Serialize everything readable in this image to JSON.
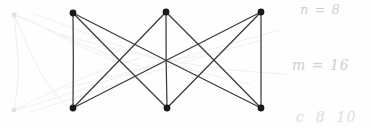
{
  "figure": {
    "background_color": "#fefefe",
    "width": 371,
    "height": 128
  },
  "graph": {
    "vertex_color": "#1a1a1a",
    "edge_color": "#3a3a3a",
    "vertex_radius": 3.4,
    "edge_width": 1.25,
    "vertices": [
      {
        "id": "t1",
        "label": "",
        "x": 73,
        "y": 13,
        "row": "top",
        "column": 1
      },
      {
        "id": "t2",
        "label": "",
        "x": 166,
        "y": 12,
        "row": "top",
        "column": 2
      },
      {
        "id": "t3",
        "label": "",
        "x": 261,
        "y": 12,
        "row": "top",
        "column": 3
      },
      {
        "id": "b1",
        "label": "",
        "x": 73,
        "y": 108,
        "row": "bottom",
        "column": 1
      },
      {
        "id": "b2",
        "label": "",
        "x": 167,
        "y": 108,
        "row": "bottom",
        "column": 2
      },
      {
        "id": "b3",
        "label": "",
        "x": 261,
        "y": 108,
        "row": "bottom",
        "column": 3
      }
    ],
    "edges": [
      {
        "from": "t1",
        "to": "b1",
        "kind": "vertical"
      },
      {
        "from": "t2",
        "to": "b2",
        "kind": "vertical"
      },
      {
        "from": "t3",
        "to": "b3",
        "kind": "vertical"
      },
      {
        "from": "t1",
        "to": "b2",
        "kind": "diagonal"
      },
      {
        "from": "t2",
        "to": "b1",
        "kind": "diagonal"
      },
      {
        "from": "t2",
        "to": "b3",
        "kind": "diagonal"
      },
      {
        "from": "t3",
        "to": "b2",
        "kind": "diagonal"
      },
      {
        "from": "t1",
        "to": "b3",
        "kind": "long-diagonal"
      },
      {
        "from": "t3",
        "to": "b1",
        "kind": "long-diagonal"
      }
    ],
    "vertex_count": 6,
    "edge_count": 9
  },
  "ghost": {
    "description": "faint erased/underlying pencil traces at left",
    "color": "#ededed",
    "stroke_width": 0.9,
    "vertices": [
      {
        "id": "g_t",
        "x": 14,
        "y": 15
      },
      {
        "id": "g_b",
        "x": 14,
        "y": 110
      }
    ],
    "curves": [
      "M14,15 C40,22 70,45 118,62",
      "M14,15 C52,30 96,52 150,70",
      "M14,15 C30,48 40,86 72,109",
      "M14,110 C44,96 84,74 140,58",
      "M14,110 C60,100 120,72 196,56",
      "M14,110 C22,70 16,40 14,16",
      "M34,14 C92,34 160,66 250,84",
      "M30,112 C96,92 170,64 262,40",
      "M60,34 C130,54 200,70 286,74",
      "M66,88 C140,70 208,50 280,30"
    ]
  },
  "annotations": [
    {
      "id": "n",
      "text": "n = 8",
      "x": 300,
      "y": 2,
      "color": "#cfcfcf"
    },
    {
      "id": "m",
      "text": "m = 16",
      "x": 292,
      "y": 57,
      "color": "#cfcfcf"
    },
    {
      "id": "c",
      "text": "c  8  10",
      "x": 296,
      "y": 109,
      "color": "#dcdcdc"
    }
  ]
}
